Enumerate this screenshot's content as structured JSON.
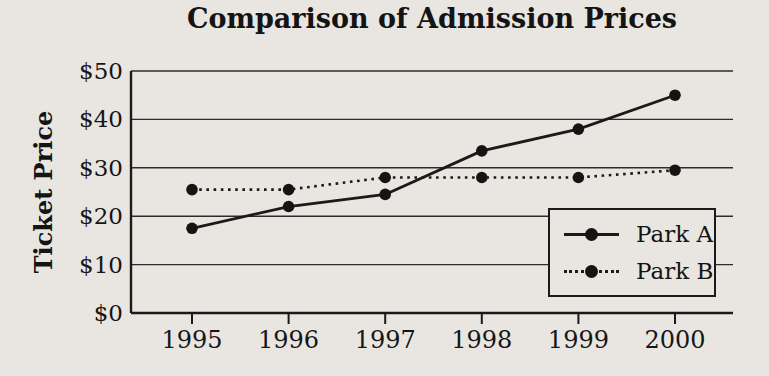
{
  "page": {
    "background_color": "#e9e6e1",
    "ink_color": "#1a1a1a"
  },
  "chart_data": {
    "type": "line",
    "title": "Comparison of Admission Prices",
    "xlabel": "",
    "ylabel": "Ticket Price",
    "categories": [
      "1995",
      "1996",
      "1997",
      "1998",
      "1999",
      "2000"
    ],
    "series": [
      {
        "name": "Park A",
        "line_style": "solid",
        "marker": "filled-circle",
        "color": "#1a1a1a",
        "values": [
          17.5,
          22,
          24.5,
          33.5,
          38,
          45
        ]
      },
      {
        "name": "Park B",
        "line_style": "dotted",
        "marker": "filled-circle",
        "color": "#1a1a1a",
        "values": [
          25.5,
          25.5,
          28,
          28,
          28,
          29.5
        ]
      }
    ],
    "ylim": [
      0,
      50
    ],
    "y_ticks": [
      0,
      10,
      20,
      30,
      40,
      50
    ],
    "y_tick_labels": [
      "$0",
      "$10",
      "$20",
      "$30",
      "$40",
      "$50"
    ],
    "grid": "horizontal",
    "legend_position": "inside-bottom-right"
  }
}
